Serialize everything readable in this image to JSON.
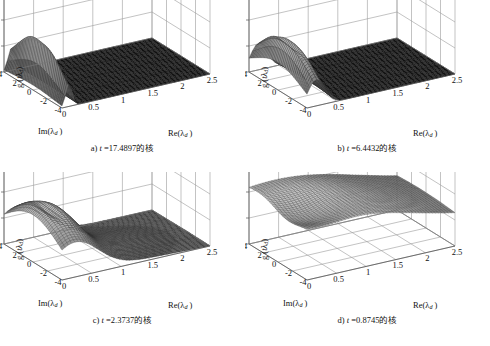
{
  "figure": {
    "background": "#ffffff",
    "axis_color": "#9a9a9a",
    "text_color": "#111111",
    "surface_line_color": "#333333",
    "bottom_fragment": ""
  },
  "axes": {
    "z_label_prefix": "g (",
    "z_label_var": "t",
    "z_label_lambda": "λ",
    "z_label_sub": "d",
    "z_label_suffix": ")",
    "im_label": "Im(λ",
    "im_label_sub": "d",
    "im_label_suffix": " )",
    "re_label": "Re(λ",
    "re_label_sub": "d",
    "re_label_suffix": " )",
    "z_ticks": [
      "0",
      "0.5",
      "1",
      "1.5"
    ],
    "z_values": [
      0,
      0.5,
      1,
      1.5
    ],
    "im_ticks": [
      "4",
      "2",
      "0",
      "-2",
      "-4"
    ],
    "im_values": [
      4,
      2,
      0,
      -2,
      -4
    ],
    "re_ticks": [
      "0",
      "0.5",
      "1",
      "1.5",
      "2",
      "2.5"
    ],
    "re_values": [
      0,
      0.5,
      1,
      1.5,
      2,
      2.5
    ]
  },
  "panels": [
    {
      "id": "a",
      "caption_prefix": "a) ",
      "caption_var": "t",
      "caption_value": " =17.4897",
      "caption_suffix": "的核",
      "t": 17.4897,
      "show_im_label": true,
      "ridge_center_re": 0.12,
      "ridge_width_re": 0.055,
      "ridge_width_im": 3.0,
      "peak": 1.02
    },
    {
      "id": "b",
      "caption_prefix": "b) ",
      "caption_var": "t",
      "caption_value": " =6.4432",
      "caption_suffix": "的核",
      "t": 6.4432,
      "show_im_label": false,
      "ridge_center_re": 0.16,
      "ridge_width_re": 0.14,
      "ridge_width_im": 3.4,
      "peak": 1.02
    },
    {
      "id": "c",
      "caption_prefix": "c) ",
      "caption_var": "t",
      "caption_value": " =2.3737",
      "caption_suffix": "的核",
      "t": 2.3737,
      "show_im_label": true,
      "ridge_center_re": 0.22,
      "ridge_width_re": 0.4,
      "ridge_width_im": 4.2,
      "peak": 1.05
    },
    {
      "id": "d",
      "caption_prefix": "d) ",
      "caption_var": "t",
      "caption_value": " =0.8745",
      "caption_suffix": "的核",
      "t": 0.8745,
      "show_im_label": true,
      "ridge_center_re": 0.35,
      "ridge_width_re": 1.25,
      "ridge_width_im": 7.5,
      "peak": 1.18
    }
  ],
  "chart_data": {
    "type": "surface",
    "title": "",
    "panel_count": 4,
    "xlabel": "Re(λ_d)",
    "ylabel": "Im(λ_d)",
    "zlabel": "g(tλ_d)",
    "xlim": [
      0,
      2.5
    ],
    "ylim": [
      -4,
      4
    ],
    "zlim": [
      0,
      1.5
    ],
    "xticks": [
      0,
      0.5,
      1,
      1.5,
      2,
      2.5
    ],
    "yticks": [
      -4,
      -2,
      0,
      2,
      4
    ],
    "zticks": [
      0,
      0.5,
      1,
      1.5
    ],
    "grid": true,
    "legend": "none",
    "projection": "3d-mesh",
    "series": [
      {
        "name": "a) t =17.4897",
        "t": 17.4897,
        "description": "Very narrow tall spike near Re=0.1, amplitude ~1.0, flat zero elsewhere",
        "peak_value": 1.0,
        "peak_at": {
          "re": 0.12,
          "im": 0.0
        },
        "half_width_re": 0.06,
        "baseline": 0.0
      },
      {
        "name": "b) t =6.4432",
        "t": 6.4432,
        "description": "Narrow ridge near Re=0.15 with slight double crest, amplitude ~1.0",
        "peak_value": 1.0,
        "peak_at": {
          "re": 0.16,
          "im": 0.5
        },
        "half_width_re": 0.15,
        "baseline": 0.0
      },
      {
        "name": "c) t =2.3737",
        "t": 2.3737,
        "description": "Broader plateau ridge spanning Re 0 to ~0.8, amplitude ~1.05 with tail to Re=2.5",
        "peak_value": 1.05,
        "peak_at": {
          "re": 0.25,
          "im": 0.5
        },
        "half_width_re": 0.45,
        "baseline": 0.05
      },
      {
        "name": "d) t =0.8745",
        "t": 0.8745,
        "description": "Wide smooth saddle surface covering full domain, values ~0.4 to 1.2",
        "peak_value": 1.2,
        "peak_at": {
          "re": 0.3,
          "im": 2.5
        },
        "half_width_re": 1.3,
        "baseline": 0.4
      }
    ]
  }
}
